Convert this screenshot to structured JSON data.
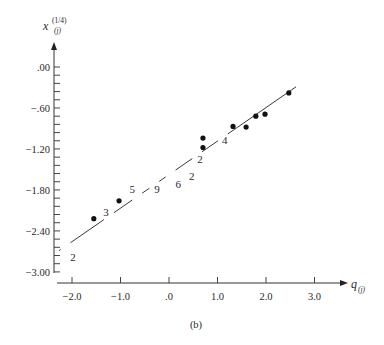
{
  "chart_data": {
    "type": "scatter",
    "title": "",
    "caption": "(b)",
    "xlabel": {
      "base": "q",
      "sub": "(j)"
    },
    "ylabel": {
      "base": "x",
      "sup": "(1/4)",
      "sub": "(j)"
    },
    "xlim": [
      -2.3,
      3.7
    ],
    "ylim": [
      -3.0,
      0.35
    ],
    "grid": false,
    "legend": null,
    "x_ticks": [
      {
        "value": -2.0,
        "label": "−2.0"
      },
      {
        "value": -1.0,
        "label": "−1.0"
      },
      {
        "value": 0.0,
        "label": ".0"
      },
      {
        "value": 1.0,
        "label": "1.0"
      },
      {
        "value": 2.0,
        "label": "2.0"
      },
      {
        "value": 3.0,
        "label": "3.0"
      }
    ],
    "y_ticks": [
      {
        "value": 0.0,
        "label": ".00"
      },
      {
        "value": -0.6,
        "label": "−.60"
      },
      {
        "value": -1.2,
        "label": "−1.20"
      },
      {
        "value": -1.8,
        "label": "−1.80"
      },
      {
        "value": -2.4,
        "label": "−2.40"
      },
      {
        "value": -3.0,
        "label": "−3.00"
      }
    ],
    "y_minor_step": 0.12,
    "series": [
      {
        "name": "observations",
        "kind": "points",
        "points": [
          {
            "x": -1.55,
            "y": -2.22
          },
          {
            "x": -1.03,
            "y": -1.96
          },
          {
            "x": 0.7,
            "y": -1.04
          },
          {
            "x": 0.7,
            "y": -1.18
          },
          {
            "x": 1.32,
            "y": -0.87
          },
          {
            "x": 1.59,
            "y": -0.88
          },
          {
            "x": 1.79,
            "y": -0.72
          },
          {
            "x": 1.98,
            "y": -0.69
          },
          {
            "x": 2.47,
            "y": -0.38
          }
        ]
      },
      {
        "name": "multiplicity-labels",
        "kind": "counts",
        "points": [
          {
            "x": -1.98,
            "y": -2.78,
            "label": "2"
          },
          {
            "x": -1.3,
            "y": -2.12,
            "label": "3"
          },
          {
            "x": -0.76,
            "y": -1.79,
            "label": "5"
          },
          {
            "x": -0.25,
            "y": -1.78,
            "label": "9"
          },
          {
            "x": 0.19,
            "y": -1.72,
            "label": "6"
          },
          {
            "x": 0.47,
            "y": -1.6,
            "label": "2"
          },
          {
            "x": 0.64,
            "y": -1.35,
            "label": "2"
          },
          {
            "x": 1.15,
            "y": -1.07,
            "label": "4"
          }
        ]
      },
      {
        "name": "reference-line",
        "kind": "line",
        "start": {
          "x": -2.27,
          "y": -2.69
        },
        "end": {
          "x": 2.62,
          "y": -0.29
        }
      }
    ]
  },
  "layout": {
    "x_px": {
      "origin_value": 0.0,
      "origin_px": 169,
      "px_per_unit": 48.5
    },
    "y_px": {
      "origin_value": 0.0,
      "origin_px": 67,
      "px_per_unit": 68.3
    },
    "y_axis_x": 54,
    "y_axis_top": 42,
    "y_axis_bottom": 273,
    "x_axis_y": 283,
    "x_axis_left": 57,
    "x_axis_right": 348
  }
}
